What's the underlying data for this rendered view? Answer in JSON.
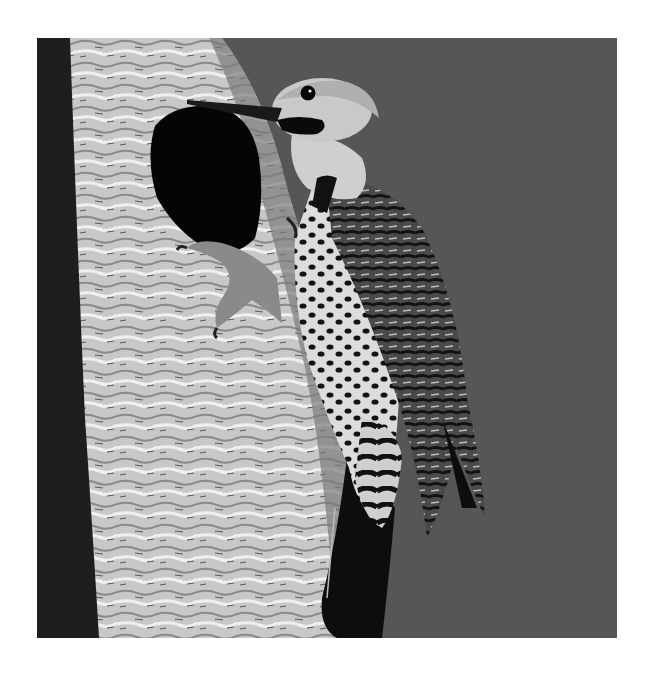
{
  "image": {
    "subject": "Northern flicker woodpecker clinging to palm trunk beside nest hole",
    "style": "black-and-white photograph",
    "frame": {
      "x": 37,
      "y": 38,
      "width": 580,
      "height": 600
    },
    "colors": {
      "page_background": "#ffffff",
      "sky_background": "#565656",
      "trunk_light": "#d8d8d8",
      "trunk_mid": "#a8a8a8",
      "trunk_shadow": "#1e1e1e",
      "nest_hole": "#050505",
      "bird_head": "#c9c9c9",
      "bird_body": "#dcdcdc",
      "bird_wing": "#2a2a2a",
      "bird_spots": "#111111"
    }
  }
}
